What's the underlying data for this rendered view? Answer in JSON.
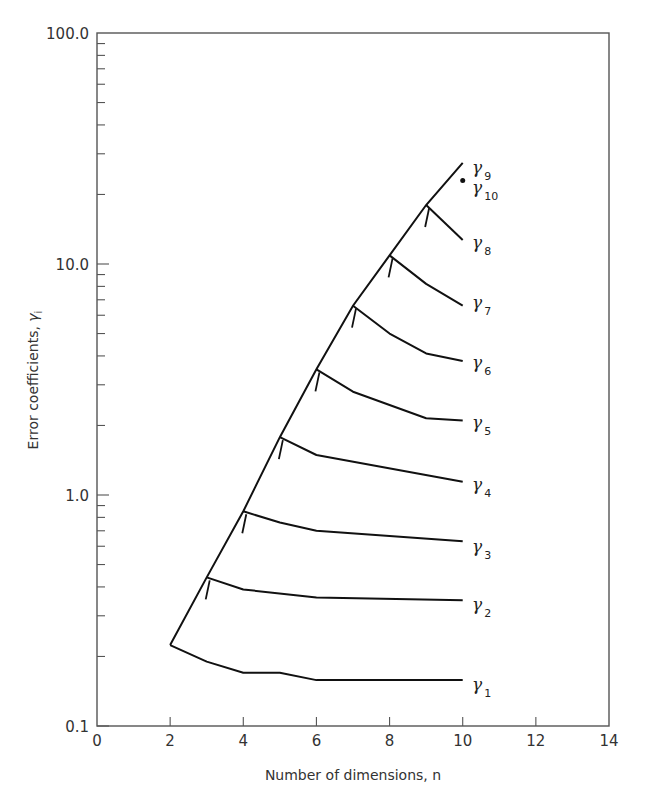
{
  "chart_data": {
    "type": "line",
    "title": "",
    "xlabel": "Number of dimensions, n",
    "ylabel": "Error coefficients, γi",
    "xlim": [
      0,
      14
    ],
    "ylim": [
      0.1,
      100.0
    ],
    "yscale": "log",
    "grid": false,
    "legend": "inline labels at right end of each curve",
    "x_ticks": [
      "0",
      "2",
      "4",
      "6",
      "8",
      "10",
      "12",
      "14"
    ],
    "y_ticks": [
      "0.1",
      "1.0",
      "10.0",
      "100.0"
    ],
    "envelope_note": "Each curve gamma_i starts at n=i+1 on a rising envelope line; small tick marks indicate each branching point",
    "series": [
      {
        "name": "γ1",
        "sub": "1",
        "x": [
          2,
          3,
          4,
          5,
          6,
          10
        ],
        "y": [
          0.224,
          0.19,
          0.17,
          0.17,
          0.158,
          0.158
        ]
      },
      {
        "name": "γ2",
        "sub": "2",
        "x": [
          3,
          4,
          6,
          10
        ],
        "y": [
          0.44,
          0.39,
          0.36,
          0.35
        ]
      },
      {
        "name": "γ3",
        "sub": "3",
        "x": [
          4,
          5,
          6,
          10
        ],
        "y": [
          0.85,
          0.76,
          0.7,
          0.63
        ]
      },
      {
        "name": "γ4",
        "sub": "4",
        "x": [
          5,
          6,
          10
        ],
        "y": [
          1.78,
          1.49,
          1.14
        ]
      },
      {
        "name": "γ5",
        "sub": "5",
        "x": [
          6,
          7,
          9,
          10
        ],
        "y": [
          3.5,
          2.8,
          2.15,
          2.1
        ]
      },
      {
        "name": "γ6",
        "sub": "6",
        "x": [
          7,
          8,
          9,
          10
        ],
        "y": [
          6.6,
          5.0,
          4.1,
          3.8
        ]
      },
      {
        "name": "γ7",
        "sub": "7",
        "x": [
          8,
          9,
          10
        ],
        "y": [
          10.9,
          8.2,
          6.6
        ]
      },
      {
        "name": "γ8",
        "sub": "8",
        "x": [
          9,
          10
        ],
        "y": [
          18.0,
          12.7
        ]
      },
      {
        "name": "γ9",
        "sub": "9",
        "x": [
          10
        ],
        "y": [
          27.4
        ]
      },
      {
        "name": "γ10",
        "sub": "10",
        "x": [
          10
        ],
        "y": [
          23.0
        ],
        "marker": "dot"
      }
    ],
    "envelope": {
      "x": [
        2,
        3,
        4,
        5,
        6,
        7,
        8,
        9,
        10
      ],
      "y": [
        0.224,
        0.44,
        0.85,
        1.78,
        3.5,
        6.6,
        10.9,
        18.0,
        27.4
      ]
    }
  },
  "labels": {
    "xlabel": "Number of dimensions, n",
    "ylabel_main": "Error coefficients, ",
    "ylabel_symbol": "γ",
    "ylabel_sub": "i",
    "gamma": "γ"
  }
}
